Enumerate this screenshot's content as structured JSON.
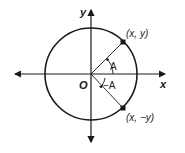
{
  "diagram": {
    "axes": {
      "x_label": "x",
      "y_label": "y",
      "origin_label": "O"
    },
    "points": [
      {
        "label": "(x, y)"
      },
      {
        "label": "(x, −y)"
      }
    ],
    "angles": [
      {
        "label": "A"
      },
      {
        "label": "−A"
      }
    ],
    "colors": {
      "stroke": "#1a1a1a",
      "background": "#ffffff"
    }
  }
}
